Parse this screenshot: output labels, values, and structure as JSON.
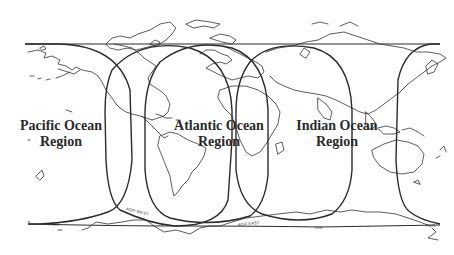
{
  "map": {
    "title": "Satellite ocean region coverage map",
    "regions": [
      {
        "name": "pacific",
        "line1": "Pacific Ocean",
        "line2": "Region"
      },
      {
        "name": "atlantic",
        "line1": "Atlantic Ocean",
        "line2": "Region"
      },
      {
        "name": "indian",
        "line1": "Indian Ocean",
        "line2": "Region"
      }
    ],
    "footprint_labels": [
      "POR",
      "AOR WEST",
      "AOR EAST",
      "IOR",
      "POR"
    ],
    "colors": {
      "line": "#2b2b2b",
      "background": "#ffffff",
      "text": "#2a2a2a"
    }
  }
}
